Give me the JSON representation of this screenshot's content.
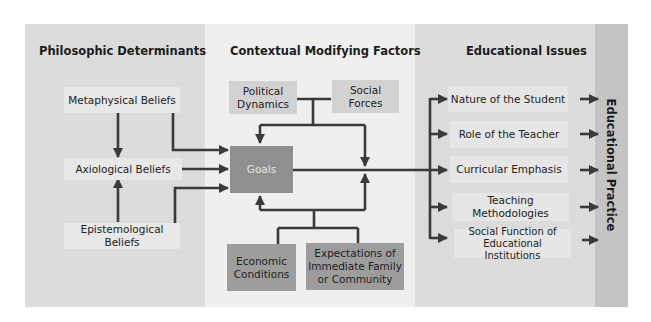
{
  "columns": {
    "left": {
      "title": "Philosophic Determinants"
    },
    "middle": {
      "title": "Contextual Modifying Factors"
    },
    "right": {
      "title": "Educational Issues"
    },
    "outcome": {
      "title": "Educational Practice"
    }
  },
  "philosophic": {
    "metaphysical": "Metaphysical Beliefs",
    "axiological": "Axiological Beliefs",
    "epistemological": "Epistemological Beliefs"
  },
  "contextual": {
    "political": "Political Dynamics",
    "social": "Social Forces",
    "goals": "Goals",
    "economic": "Economic Conditions",
    "expectations": "Expectations of Immediate Family or Community"
  },
  "issues": [
    "Nature of the Student",
    "Role of the Teacher",
    "Curricular Emphasis",
    "Teaching Methodologies",
    "Social Function of Educational Institutions"
  ],
  "colors": {
    "panel_side": "#dcdcdc",
    "panel_middle": "#efefef",
    "strip": "#c4c4c4",
    "goals_box": "#8f8f8f",
    "arrow": "#3a3a3a"
  }
}
